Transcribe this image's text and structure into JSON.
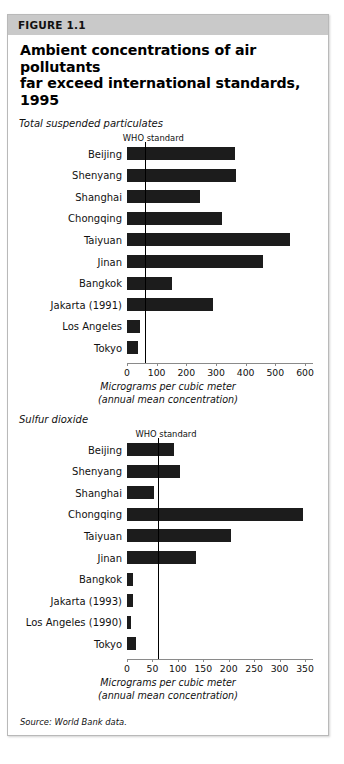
{
  "figure": {
    "number_label": "FIGURE 1.1",
    "title_line_1": "Ambient concentrations of air pollutants",
    "title_line_2": "far exceed international standards, 1995",
    "source": "Source: World Bank data.",
    "accent_band_color": "#c9c9c9",
    "bar_color": "#1c1c1c",
    "frame_color": "#b9b9b9"
  },
  "chart_data": [
    {
      "type": "bar",
      "orientation": "horizontal",
      "title": "Total suspended particulates",
      "xlabel": "Micrograms per cubic meter",
      "xlabel_line_2": "(annual mean concentration)",
      "ylabel": "",
      "xlim": [
        0,
        600
      ],
      "ticks": [
        0,
        100,
        200,
        300,
        400,
        500,
        600
      ],
      "tick_labels": [
        "0",
        "100",
        "200",
        "300",
        "400",
        "500",
        "600"
      ],
      "grid": false,
      "legend": false,
      "annotation": "WHO standard",
      "annotation_value": 60,
      "categories": [
        "Beijing",
        "Shenyang",
        "Shanghai",
        "Chongqing",
        "Taiyuan",
        "Jinan",
        "Bangkok",
        "Jakarta (1991)",
        "Los Angeles",
        "Tokyo"
      ],
      "values": [
        364,
        367,
        246,
        320,
        549,
        458,
        152,
        290,
        44,
        37
      ]
    },
    {
      "type": "bar",
      "orientation": "horizontal",
      "title": "Sulfur dioxide",
      "xlabel": "Micrograms per cubic meter",
      "xlabel_line_2": "(annual mean concentration)",
      "ylabel": "",
      "xlim": [
        0,
        350
      ],
      "ticks": [
        0,
        50,
        100,
        150,
        200,
        250,
        300,
        350
      ],
      "tick_labels": [
        "0",
        "50",
        "100",
        "150",
        "200",
        "250",
        "300",
        "350"
      ],
      "grid": false,
      "legend": false,
      "annotation": "WHO standard",
      "annotation_value": 60,
      "categories": [
        "Beijing",
        "Shenyang",
        "Shanghai",
        "Chongqing",
        "Taiyuan",
        "Jinan",
        "Bangkok",
        "Jakarta (1993)",
        "Los Angeles (1990)",
        "Tokyo"
      ],
      "values": [
        93,
        105,
        54,
        346,
        205,
        135,
        11,
        11,
        7,
        18
      ]
    }
  ]
}
